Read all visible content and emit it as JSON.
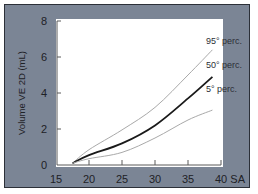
{
  "chart_data": {
    "type": "line",
    "title": "",
    "xlabel": "SA",
    "ylabel": "Volume VE 2D (mL)",
    "xlim": [
      15,
      40
    ],
    "ylim": [
      0,
      8
    ],
    "x_ticks": [
      15,
      20,
      25,
      30,
      35,
      40
    ],
    "x_tick_labels": [
      "15",
      "20",
      "25",
      "30",
      "35",
      "40 SA"
    ],
    "y_ticks": [
      0,
      2,
      4,
      6,
      8
    ],
    "y_tick_labels": [
      "0",
      "2",
      "4",
      "6",
      "8"
    ],
    "grid": false,
    "legend": "inline labels at curve ends",
    "x": [
      17.5,
      20,
      25,
      30,
      35,
      38.7
    ],
    "series": [
      {
        "name": "95° perc.",
        "values": [
          0.1,
          0.85,
          1.95,
          3.2,
          5.0,
          6.4
        ],
        "color": "#a9a9a9",
        "width": 1
      },
      {
        "name": "50° perc.",
        "values": [
          0.1,
          0.55,
          1.2,
          2.2,
          3.7,
          4.9
        ],
        "color": "#1a1a1a",
        "width": 1.8
      },
      {
        "name": "5° perc.",
        "values": [
          0.1,
          0.35,
          0.7,
          1.5,
          2.5,
          3.05
        ],
        "color": "#a9a9a9",
        "width": 1
      }
    ]
  },
  "colors": {
    "frame_bg": "#7b8595",
    "frame_border": "#2c3038",
    "plot_bg": "#ffffff",
    "axis": "#5a5a5a"
  }
}
